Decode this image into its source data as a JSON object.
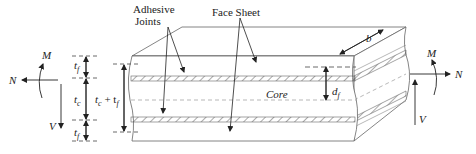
{
  "diagram": {
    "labels": {
      "adhesive_joints_line1": "Adhesive",
      "adhesive_joints_line2": "Joints",
      "face_sheet": "Face Sheet",
      "core": "Core",
      "width": "b",
      "face_distance": "d",
      "face_distance_sub": "f"
    },
    "left_loads": {
      "moment": "M",
      "normal": "N",
      "shear": "V"
    },
    "right_loads": {
      "moment": "M",
      "normal": "N",
      "shear": "V"
    },
    "thickness_dims": {
      "top_face": "t",
      "top_face_sub": "f",
      "core": "t",
      "core_sub": "c",
      "bottom_face": "t",
      "bottom_face_sub": "f",
      "total_main": "t",
      "total_main_sub": "c",
      "total_plus": " + t",
      "total_plus_sub": "f"
    },
    "colors": {
      "line": "#3a3a3a",
      "light_line": "#8a8a8a",
      "text": "#222222",
      "background": "#ffffff"
    }
  }
}
